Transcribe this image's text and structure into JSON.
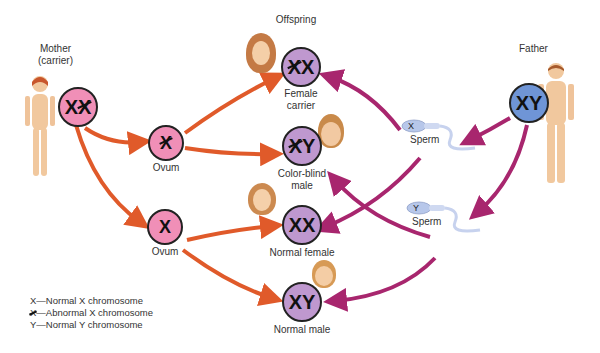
{
  "mother": {
    "label_line1": "Mother",
    "label_line2": "(carrier)",
    "genotype": [
      "X",
      "Xc"
    ],
    "color": "#f08fb7"
  },
  "father": {
    "label": "Father",
    "genotype": [
      "X",
      "Y"
    ],
    "color": "#6f95d6"
  },
  "gametes": {
    "ovum_abnormal": {
      "label": "Ovum",
      "chromosome": "Xc"
    },
    "ovum_normal": {
      "label": "Ovum",
      "chromosome": "X"
    },
    "sperm_x": {
      "label": "Sperm",
      "chromosome": "X"
    },
    "sperm_y": {
      "label": "Sperm",
      "chromosome": "Y"
    }
  },
  "offspring": {
    "heading": "Offspring",
    "items": [
      {
        "genotype": [
          "Xc",
          "X"
        ],
        "label_line1": "Female",
        "label_line2": "carrier"
      },
      {
        "genotype": [
          "Xc",
          "Y"
        ],
        "label_line1": "Color-blind",
        "label_line2": "male"
      },
      {
        "genotype": [
          "X",
          "X"
        ],
        "label_line1": "Normal female",
        "label_line2": ""
      },
      {
        "genotype": [
          "X",
          "Y"
        ],
        "label_line1": "Normal male",
        "label_line2": ""
      }
    ],
    "color": "#bf98cf"
  },
  "legend": {
    "items": [
      {
        "symbol": "X",
        "text": "—Normal X chromosome"
      },
      {
        "symbol": "X",
        "text": "—Abnormal X chromosome"
      },
      {
        "symbol": "Y",
        "text": "—Normal Y chromosome"
      }
    ]
  },
  "colors": {
    "maternal_arrow": "#e05a2a",
    "paternal_arrow": "#a8266e"
  }
}
